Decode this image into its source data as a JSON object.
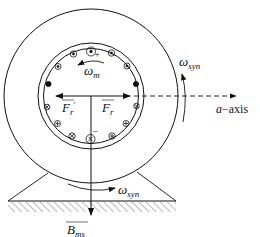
{
  "diagram": {
    "type": "machine cross-section",
    "labels": {
      "omega_m": {
        "main": "ω",
        "sub": "m"
      },
      "omega_syn_right": {
        "main": "ω",
        "sub": "syn"
      },
      "omega_syn_bottom": {
        "main": "ω",
        "sub": "syn"
      },
      "a_axis": {
        "italic": "a",
        "rest": "−axis"
      },
      "Fr_prime": {
        "main": "F",
        "sub": "r",
        "prime": "'"
      },
      "Fr": {
        "main": "F",
        "sub": "r"
      },
      "B_ms": {
        "main": "B",
        "sub": "ms"
      },
      "plus_top": "+",
      "minus_bottom": "−"
    },
    "conductor_symbols": {
      "dot": "current out of page",
      "cross": "current into page"
    },
    "colors": {
      "stroke": "#111111",
      "background": "#ffffff"
    }
  }
}
